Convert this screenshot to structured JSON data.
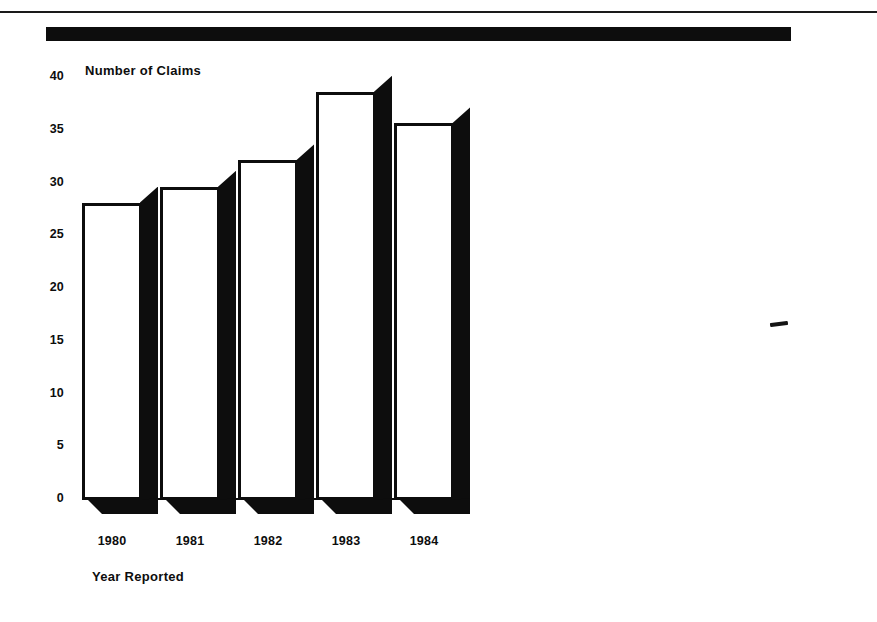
{
  "page": {
    "header_rule": "horizontal-rule",
    "header_bar": "solid-black-banner",
    "artifact": "scan-dash-mark"
  },
  "chart_data": {
    "type": "bar",
    "title": "Number of Claims",
    "subtitle": "",
    "xlabel": "Year Reported",
    "ylabel": "Number of Claims",
    "categories": [
      "1980",
      "1981",
      "1982",
      "1983",
      "1984"
    ],
    "values": [
      28,
      29.5,
      32,
      38.5,
      35.5
    ],
    "yticks": [
      "40",
      "35",
      "30",
      "25",
      "20",
      "15",
      "10",
      "5",
      "0"
    ],
    "ytick_values": [
      40,
      35,
      30,
      25,
      20,
      15,
      10,
      5,
      0
    ],
    "ylim": [
      0,
      40
    ],
    "grid": false,
    "legend": "none",
    "style": "3d-white-bars-black-shadow",
    "colors": {
      "bar_face": "#ffffff",
      "bar_outline": "#0d0d0d",
      "bar_shadow": "#0d0d0d",
      "text": "#0d0d0d",
      "background": "#ffffff"
    }
  }
}
